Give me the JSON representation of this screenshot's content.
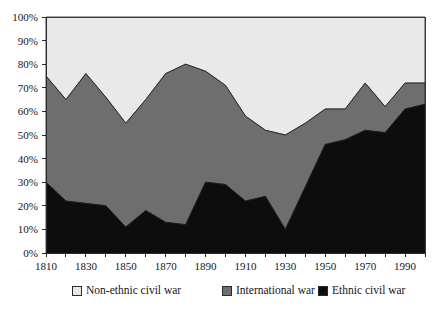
{
  "chart_data": {
    "type": "area",
    "stacked": true,
    "title": "",
    "subtitle": "",
    "xlabel": "",
    "ylabel": "",
    "grid": false,
    "legend_position": "bottom",
    "xlim": [
      1810,
      2000
    ],
    "ylim": [
      0,
      100
    ],
    "y_tick_step": 10,
    "x_tick_step": 10,
    "x_label_step": 20,
    "x": [
      1810,
      1820,
      1830,
      1840,
      1850,
      1860,
      1870,
      1880,
      1890,
      1900,
      1910,
      1920,
      1930,
      1940,
      1950,
      1960,
      1970,
      1980,
      1990,
      2000
    ],
    "x_tick_labels": [
      "1810",
      "1830",
      "1850",
      "1870",
      "1890",
      "1910",
      "1930",
      "1950",
      "1970",
      "1990"
    ],
    "y_tick_labels": [
      "0%",
      "10%",
      "20%",
      "30%",
      "40%",
      "50%",
      "60%",
      "70%",
      "80%",
      "90%",
      "100%"
    ],
    "series": [
      {
        "name": "Ethnic civil war",
        "color": "#0d0d0d",
        "values": [
          30,
          22,
          21,
          20,
          11,
          18,
          13,
          12,
          30,
          29,
          22,
          24,
          10,
          28,
          46,
          48,
          52,
          51,
          61,
          63
        ]
      },
      {
        "name": "International war",
        "color": "#6e6e6e",
        "values": [
          45,
          43,
          55,
          46,
          44,
          47,
          63,
          68,
          47,
          42,
          36,
          28,
          40,
          27,
          15,
          13,
          20,
          11,
          11,
          9
        ]
      },
      {
        "name": "Non-ethnic civil war",
        "color": "#e9e9e9",
        "values": [
          25,
          35,
          24,
          34,
          45,
          35,
          24,
          20,
          23,
          29,
          42,
          48,
          50,
          45,
          39,
          39,
          28,
          38,
          28,
          28
        ]
      }
    ],
    "cumulative_tops": {
      "ethnic_civil_war": [
        30,
        22,
        21,
        20,
        11,
        18,
        13,
        12,
        30,
        29,
        22,
        24,
        10,
        28,
        46,
        48,
        52,
        51,
        61,
        63
      ],
      "international_war": [
        75,
        65,
        76,
        66,
        55,
        65,
        76,
        80,
        77,
        71,
        58,
        52,
        50,
        55,
        61,
        61,
        72,
        62,
        72,
        72
      ],
      "non_ethnic_civil_war": [
        100,
        100,
        100,
        100,
        100,
        100,
        100,
        100,
        100,
        100,
        100,
        100,
        100,
        100,
        100,
        100,
        100,
        100,
        100,
        100
      ]
    }
  },
  "legend": {
    "items": [
      {
        "label": "Non-ethnic civil war",
        "color": "#e9e9e9",
        "swatch": "square-outline-swatch"
      },
      {
        "label": "International war",
        "color": "#6e6e6e",
        "swatch": "square-filled-swatch"
      },
      {
        "label": "Ethnic civil war",
        "color": "#0d0d0d",
        "swatch": "square-filled-swatch"
      }
    ]
  }
}
